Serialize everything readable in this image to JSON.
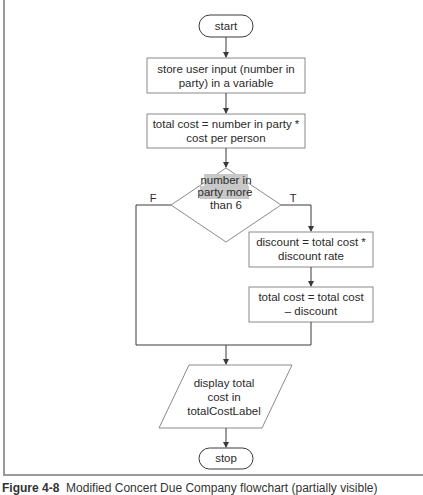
{
  "diagram": {
    "type": "flowchart",
    "nodes": {
      "start": {
        "shape": "terminator",
        "label": "start"
      },
      "store_input": {
        "shape": "process",
        "lines": [
          "store user input (number in",
          "party) in a variable"
        ]
      },
      "calc_total": {
        "shape": "process",
        "lines": [
          "total cost = number in party *",
          "cost per person"
        ]
      },
      "decision": {
        "shape": "decision",
        "lines": [
          "number in",
          "party more",
          "than 6"
        ]
      },
      "calc_discount": {
        "shape": "process",
        "lines": [
          "discount = total cost *",
          "discount rate"
        ]
      },
      "apply_discount": {
        "shape": "process",
        "lines": [
          "total cost = total cost",
          "– discount"
        ]
      },
      "display": {
        "shape": "input-output",
        "lines": [
          "display total",
          "cost in",
          "totalCostLabel"
        ]
      },
      "stop": {
        "shape": "terminator",
        "label": "stop"
      }
    },
    "branch_labels": {
      "false": "F",
      "true": "T"
    },
    "edges": [
      [
        "start",
        "store_input"
      ],
      [
        "store_input",
        "calc_total"
      ],
      [
        "calc_total",
        "decision"
      ],
      [
        "decision",
        "calc_discount",
        "T"
      ],
      [
        "calc_discount",
        "apply_discount"
      ],
      [
        "decision",
        "display",
        "F"
      ],
      [
        "apply_discount",
        "display"
      ],
      [
        "display",
        "stop"
      ]
    ],
    "highlight_color": "#c8c8c8",
    "line_color": "#3a3a3a"
  },
  "caption": {
    "label": "Figure 4-8",
    "text": "Modified Concert Due Company flowchart (partially visible)"
  }
}
